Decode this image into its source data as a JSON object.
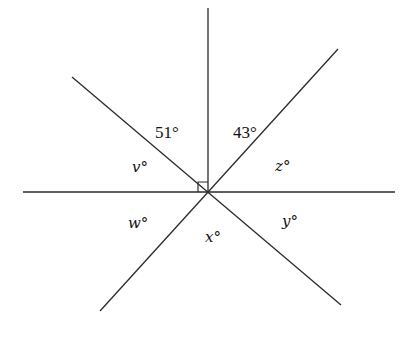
{
  "diagram": {
    "center": {
      "x": 208,
      "y": 192
    },
    "lines": [
      {
        "name": "horizontal",
        "x1": 23,
        "y1": 192,
        "x2": 395,
        "y2": 192
      },
      {
        "name": "vertical-ray",
        "x1": 208,
        "y1": 8,
        "x2": 208,
        "y2": 192
      },
      {
        "name": "upper-left-to-lower-right",
        "x1": 72,
        "y1": 77,
        "x2": 341,
        "y2": 305
      },
      {
        "name": "upper-right-to-lower-left",
        "x1": 338,
        "y1": 49,
        "x2": 100,
        "y2": 311
      }
    ],
    "right_angle_marker": {
      "x": 198,
      "y": 182,
      "size": 10
    },
    "angle_labels": [
      {
        "id": "angle-51",
        "text": "51°",
        "x": 155,
        "y": 138,
        "italic": false
      },
      {
        "id": "angle-43",
        "text": "43°",
        "x": 233,
        "y": 138,
        "italic": false
      },
      {
        "id": "angle-v",
        "text": "v°",
        "x": 132,
        "y": 172,
        "italic": true
      },
      {
        "id": "angle-z",
        "text": "z°",
        "x": 275,
        "y": 171,
        "italic": true
      },
      {
        "id": "angle-w",
        "text": "w°",
        "x": 128,
        "y": 228,
        "italic": true
      },
      {
        "id": "angle-x",
        "text": "x°",
        "x": 205,
        "y": 242,
        "italic": true
      },
      {
        "id": "angle-y",
        "text": "y°",
        "x": 282,
        "y": 226,
        "italic": true
      }
    ]
  },
  "labels": {
    "a51": "51°",
    "a43": "43°",
    "v": "v°",
    "z": "z°",
    "w": "w°",
    "x": "x°",
    "y": "y°"
  }
}
